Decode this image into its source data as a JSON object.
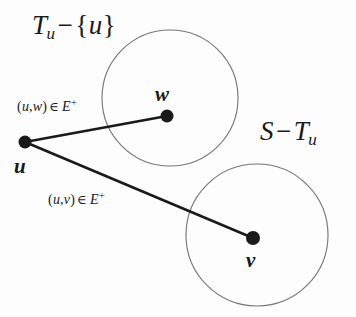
{
  "figure": {
    "background_color": "#fdfdfd",
    "ink_color": "#1a1a1a",
    "circle_stroke_color": "#777777",
    "width": 356,
    "height": 317
  },
  "regions": [
    {
      "id": "upper",
      "name": "region-tu-minus-u",
      "label_base": "T",
      "label_subscript": "u",
      "label_operator": "−",
      "label_set_open": "{",
      "label_set_member": "u",
      "label_set_close": "}",
      "label_text": "T_u − {u}",
      "cx": 170,
      "cy": 98,
      "r": 68
    },
    {
      "id": "lower",
      "name": "region-s-minus-tu",
      "label_base": "S",
      "label_operator": "−",
      "label_second": "T",
      "label_second_subscript": "u",
      "label_text": "S − T_u",
      "cx": 257,
      "cy": 235,
      "r": 71
    }
  ],
  "vertices": [
    {
      "id": "u",
      "name": "vertex-u",
      "label": "u",
      "cx": 25,
      "cy": 142,
      "r": 6.5
    },
    {
      "id": "w",
      "name": "vertex-w",
      "label": "w",
      "cx": 167,
      "cy": 116,
      "r": 6.5
    },
    {
      "id": "v",
      "name": "vertex-v",
      "label": "v",
      "cx": 253,
      "cy": 238,
      "r": 7.0
    }
  ],
  "edges": [
    {
      "id": "uw",
      "name": "edge-u-w",
      "from": "u",
      "to": "w",
      "label_open": "(",
      "label_tail": "u",
      "label_comma": ",",
      "label_head": "w",
      "label_close": ")",
      "label_relation": "∈",
      "label_set": "E",
      "label_superscript": "+",
      "label_text": "(u, w) ∈ E⁺"
    },
    {
      "id": "uv",
      "name": "edge-u-v",
      "from": "u",
      "to": "v",
      "label_open": "(",
      "label_tail": "u",
      "label_comma": ",",
      "label_head": "v",
      "label_close": ")",
      "label_relation": "∈",
      "label_set": "E",
      "label_superscript": "+",
      "label_text": "(u, v) ∈ E⁺"
    }
  ]
}
